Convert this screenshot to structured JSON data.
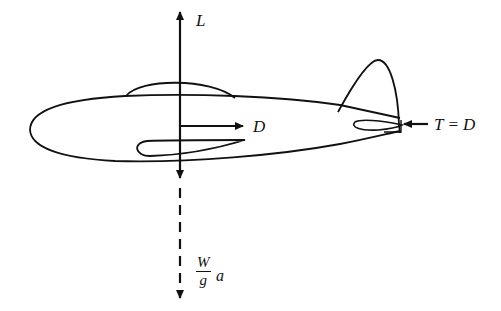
{
  "figure": {
    "forces": {
      "lift": {
        "label": "L",
        "direction": "up"
      },
      "drag": {
        "label": "D",
        "direction": "right-arrow from center"
      },
      "thrust": {
        "label": "T = D",
        "direction": "at tail, pointing left"
      },
      "inertia": {
        "numerator": "W",
        "denominator": "g",
        "suffix": "a",
        "direction": "down (dashed)"
      }
    },
    "colors": {
      "ink": "#111111",
      "background": "#ffffff"
    }
  }
}
